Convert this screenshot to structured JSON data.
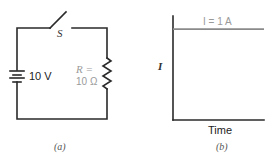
{
  "circuit": {
    "switch_label": "S",
    "battery_label": "10 V",
    "resistor_label_line1": "R =",
    "resistor_label_line2": "10 Ω",
    "caption": "(a)"
  },
  "graph": {
    "y_axis_label": "I",
    "x_axis_label": "Time",
    "line_label": "I = 1 A",
    "caption": "(b)"
  },
  "chart_data": {
    "type": "line",
    "title": "",
    "xlabel": "Time",
    "ylabel": "I",
    "series": [
      {
        "name": "I = 1 A",
        "x": [
          0,
          1
        ],
        "values": [
          1,
          1
        ]
      }
    ],
    "ylim": [
      0,
      1.1
    ],
    "grid": false
  }
}
